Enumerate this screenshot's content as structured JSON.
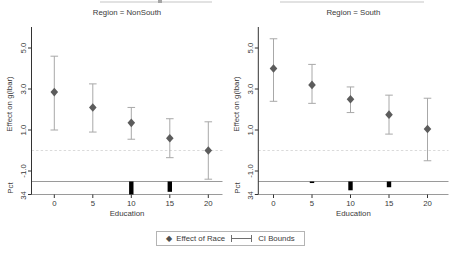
{
  "chart_data": {
    "type": "scatter",
    "x": [
      0,
      5,
      10,
      15,
      20
    ],
    "xlabel": "Education",
    "ylabel": "Effect on g(lbar)",
    "ytick_labels": [
      "5.0",
      "3.0",
      "1.0",
      "-1.0"
    ],
    "yticks": [
      5.0,
      3.0,
      1.0,
      -1.0
    ],
    "ylim": [
      -1.5,
      6.0
    ],
    "refline_y": 0,
    "grid": false,
    "panels": [
      {
        "title": "Region = NonSouth",
        "effects": [
          2.85,
          2.1,
          1.35,
          0.6,
          0.0
        ],
        "ci_low": [
          1.0,
          0.9,
          0.55,
          -0.35,
          -1.4
        ],
        "ci_high": [
          4.6,
          3.25,
          2.1,
          1.55,
          1.4
        ],
        "hist_pct": [
          0,
          0,
          34,
          27,
          0
        ]
      },
      {
        "title": "Region = South",
        "effects": [
          4.0,
          3.2,
          2.5,
          1.75,
          1.05
        ],
        "ci_low": [
          2.4,
          2.3,
          1.85,
          0.8,
          -0.5
        ],
        "ci_high": [
          5.45,
          4.2,
          3.1,
          2.7,
          2.55
        ],
        "hist_pct": [
          0,
          4,
          23,
          15,
          0
        ]
      }
    ],
    "hist_axis": {
      "label": "Pct",
      "tick_label": "34",
      "max": 34
    },
    "legend": {
      "marker_label": "Effect of Race",
      "ci_label": "CI Bounds",
      "position": "bottom-center"
    },
    "colors": {
      "marker": "#5c5c5c",
      "ci": "#a8a8a8",
      "refline": "#dadada",
      "axis": "#333333",
      "strip_line": "#8f8f8f",
      "hist_bar": "#000000",
      "text": "#3a3a3a",
      "legend_border": "#b4b4b4"
    }
  }
}
